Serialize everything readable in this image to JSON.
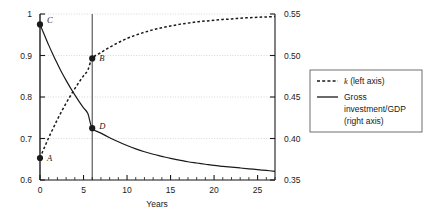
{
  "chart_data": {
    "type": "line",
    "title": "",
    "xlabel": "Years",
    "ylabel": "",
    "xlim": [
      0,
      27
    ],
    "ylim_left": [
      0.6,
      1.0
    ],
    "ylim_right": [
      0.35,
      0.55
    ],
    "grid": true,
    "legend_position": "right-outside",
    "x_ticks_major": [
      0,
      5,
      10,
      15,
      20,
      25
    ],
    "x_ticks_major_labels": [
      "0",
      "5",
      "10",
      "15",
      "20",
      "25"
    ],
    "x_tick_minor_step": 1,
    "y_left_ticks": [
      0.6,
      0.7,
      0.8,
      0.9,
      1.0
    ],
    "y_left_tick_labels": [
      "0.6",
      "0.7",
      "0.8",
      "0.9",
      "1"
    ],
    "y_right_ticks": [
      0.35,
      0.4,
      0.45,
      0.5,
      0.55
    ],
    "y_right_tick_labels": [
      "0.35",
      "0.40",
      "0.45",
      "0.50",
      "0.55"
    ],
    "vertical_marker_x": 6,
    "series": [
      {
        "name": "k (left axis)",
        "axis": "left",
        "style": "dashed",
        "color": "#1a1a1a",
        "x": [
          0,
          0.5,
          1,
          1.5,
          2,
          2.5,
          3,
          3.5,
          4,
          4.5,
          5,
          5.5,
          6,
          7,
          8,
          9,
          10,
          11,
          12,
          13,
          14,
          15,
          16,
          17,
          18,
          19,
          20,
          21,
          22,
          23,
          24,
          25,
          26,
          27
        ],
        "y": [
          0.653,
          0.678,
          0.702,
          0.724,
          0.746,
          0.766,
          0.785,
          0.803,
          0.82,
          0.836,
          0.851,
          0.865,
          0.893,
          0.907,
          0.92,
          0.931,
          0.941,
          0.949,
          0.956,
          0.962,
          0.967,
          0.971,
          0.975,
          0.978,
          0.981,
          0.983,
          0.985,
          0.987,
          0.988,
          0.99,
          0.991,
          0.992,
          0.993,
          0.994
        ]
      },
      {
        "name": "Gross investment/GDP (right axis)",
        "axis": "right",
        "style": "solid",
        "color": "#1a1a1a",
        "x": [
          0,
          0.5,
          1,
          1.5,
          2,
          2.5,
          3,
          3.5,
          4,
          4.5,
          5,
          5.5,
          6,
          7,
          8,
          9,
          10,
          11,
          12,
          13,
          14,
          15,
          16,
          17,
          18,
          19,
          20,
          21,
          22,
          23,
          24,
          25,
          26,
          27
        ],
        "y_left_scale": [
          0.975,
          0.95,
          0.925,
          0.902,
          0.88,
          0.859,
          0.84,
          0.822,
          0.805,
          0.789,
          0.774,
          0.76,
          0.725,
          0.713,
          0.702,
          0.692,
          0.683,
          0.675,
          0.668,
          0.662,
          0.657,
          0.652,
          0.648,
          0.644,
          0.641,
          0.638,
          0.635,
          0.633,
          0.631,
          0.629,
          0.627,
          0.625,
          0.623,
          0.621
        ]
      }
    ],
    "annotations": [
      {
        "label": "C",
        "x": 0,
        "y_left": 0.975,
        "series": "Gross investment/GDP (right axis)",
        "label_dx": 7,
        "label_dy": -1
      },
      {
        "label": "A",
        "x": 0,
        "y_left": 0.653,
        "series": "k (left axis)",
        "label_dx": 7,
        "label_dy": 3
      },
      {
        "label": "B",
        "x": 6,
        "y_left": 0.893,
        "series": "k (left axis)",
        "label_dx": 7,
        "label_dy": 3
      },
      {
        "label": "D",
        "x": 6,
        "y_left": 0.725,
        "series": "Gross investment/GDP (right axis)",
        "label_dx": 7,
        "label_dy": 1
      }
    ]
  },
  "legend": {
    "items": [
      {
        "label": "k (left axis)",
        "style": "dashed",
        "label_italic_lead": "k",
        "label_rest": " (left axis)"
      },
      {
        "label": "Gross investment/GDP (right axis)",
        "style": "solid",
        "line1": "Gross",
        "line2": "investment/GDP",
        "line3": "(right axis)"
      }
    ]
  },
  "colors": {
    "ink": "#1a1a1a",
    "grid": "#c8c8c8",
    "background": "#ffffff",
    "marker_line": "#4d4d4d"
  }
}
